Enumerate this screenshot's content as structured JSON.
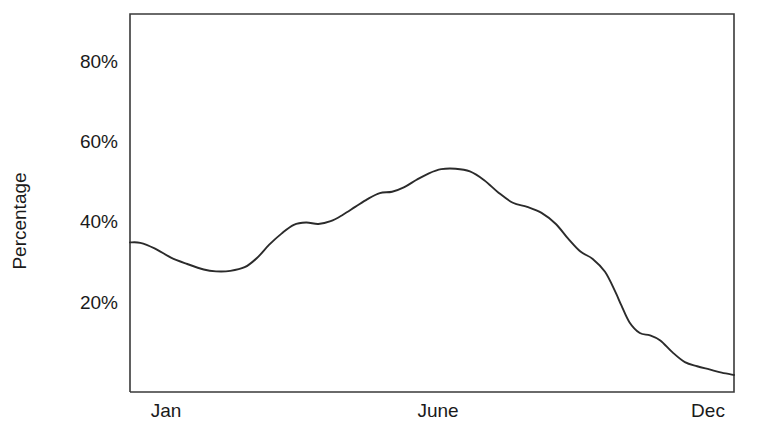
{
  "chart_data": {
    "type": "line",
    "title": "",
    "subtitle": "",
    "xlabel": "",
    "ylabel": "Percentage",
    "ylim": [
      0,
      90
    ],
    "xlim": [
      0,
      12
    ],
    "grid": false,
    "legend": null,
    "y_ticks": [
      {
        "value": 80,
        "label": "80%"
      },
      {
        "value": 60,
        "label": "60%"
      },
      {
        "value": 40,
        "label": "40%"
      },
      {
        "value": 20,
        "label": "20%"
      }
    ],
    "x_ticks": [
      {
        "value": 0.35,
        "label": "Jan"
      },
      {
        "value": 5.05,
        "label": "June"
      },
      {
        "value": 10.55,
        "label": "Dec"
      }
    ],
    "series": [
      {
        "name": "Percentage",
        "color": "#2b2b2b",
        "x": [
          0.0,
          0.25,
          0.6,
          1.0,
          1.4,
          1.8,
          2.1,
          2.45,
          2.8,
          3.1,
          3.4,
          3.7,
          4.0,
          4.3,
          4.6,
          4.9,
          5.2,
          5.5,
          5.8,
          6.1,
          6.4,
          6.7,
          7.0,
          7.3,
          7.6,
          7.95,
          8.3,
          8.65,
          9.0,
          9.35,
          9.7,
          10.05,
          10.4,
          10.7,
          11.0,
          11.3,
          11.6,
          11.85,
          12.0
        ],
        "y": [
          44.6,
          44.5,
          43.3,
          41.3,
          39.9,
          38.7,
          38.3,
          38.4,
          39.2,
          41.2,
          44.1,
          46.5,
          48.4,
          48.9,
          48.6,
          49.2,
          50.6,
          52.3,
          54.0,
          55.3,
          55.6,
          56.6,
          58.2,
          59.6,
          60.5,
          60.6,
          60.0,
          58.1,
          55.4,
          53.2,
          52.3,
          51.0,
          48.6,
          45.4,
          42.6,
          41.0,
          38.2,
          33.9,
          30.9
        ],
        "y_tail": [
          27.2,
          24.9,
          24.4,
          23.3,
          20.7,
          18.6,
          17.7,
          17.0,
          16.3,
          15.8
        ],
        "x_tail": [
          12.2,
          12.45,
          12.7,
          12.95,
          13.25,
          13.55,
          13.85,
          14.15,
          14.45,
          14.75
        ]
      }
    ],
    "annotations": []
  },
  "axis": {
    "y_title": "Percentage"
  },
  "plot_geometry": {
    "left": 130,
    "right": 734,
    "top": 14,
    "bottom": 392,
    "value_at_top": 94.2,
    "value_at_bottom": 12.1
  }
}
